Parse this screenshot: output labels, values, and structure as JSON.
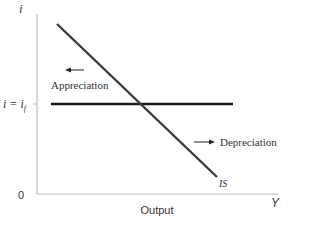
{
  "diagram": {
    "axes": {
      "y_label": "i",
      "x_label": "Y",
      "origin_label": "0",
      "x_axis_title": "Output",
      "y_tick_label_main": "i = i",
      "y_tick_label_sub": "f",
      "axis_color": "#bdbdbd"
    },
    "curves": [
      {
        "name": "IS",
        "label": "IS",
        "type": "downward-sloping line",
        "color": "#3a3a3a"
      },
      {
        "name": "interest-parity",
        "label": "i = i_f",
        "type": "horizontal line",
        "color": "#1a1a1a"
      }
    ],
    "annotations": {
      "left_region": {
        "arrow": "left",
        "text": "Appreciation"
      },
      "right_region": {
        "arrow": "right",
        "text": "Depreciation"
      }
    }
  }
}
